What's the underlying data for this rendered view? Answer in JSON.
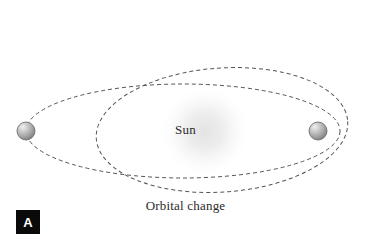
{
  "figure": {
    "panel_label": "A",
    "caption": "Orbital change",
    "background_color": "#ffffff"
  },
  "diagram": {
    "type": "orbital-diagram",
    "center_body": {
      "name": "Sun",
      "label": "Sun",
      "cx": 205,
      "cy": 131,
      "glow_radius": 46,
      "glow_color": "#ededed"
    },
    "planets": [
      {
        "name": "planet-left",
        "cx": 26,
        "cy": 131,
        "r": 9,
        "fill": "#a8a8a8",
        "highlight": "#e8e8e8",
        "stroke": "#6e6e6e"
      },
      {
        "name": "planet-right",
        "cx": 318,
        "cy": 131,
        "r": 9,
        "fill": "#a8a8a8",
        "highlight": "#e8e8e8",
        "stroke": "#6e6e6e"
      }
    ],
    "orbits": [
      {
        "name": "original-orbit",
        "cx": 183,
        "cy": 131,
        "rx": 157,
        "ry": 47,
        "rotation": 0,
        "stroke": "#555555",
        "stroke_width": 1,
        "dash": "4 3"
      },
      {
        "name": "changed-orbit",
        "cx": 222,
        "cy": 130,
        "rx": 126,
        "ry": 62,
        "rotation": -4,
        "stroke": "#555555",
        "stroke_width": 1,
        "dash": "4 3"
      }
    ]
  },
  "colors": {
    "line": "#555555",
    "text": "#2a2a2a",
    "badge_bg": "#0a0a0a",
    "badge_text": "#ffffff"
  }
}
